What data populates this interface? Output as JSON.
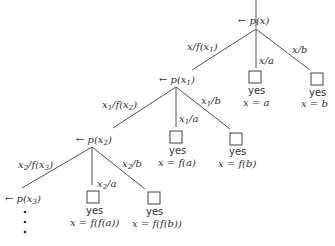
{
  "diagram": {
    "type": "search-tree",
    "nodes": [
      {
        "id": "root",
        "label": "← p(x)"
      },
      {
        "id": "n1",
        "label": "← p(x1)"
      },
      {
        "id": "n2",
        "label": "← p(x2)"
      },
      {
        "id": "n3",
        "label": "← p(x3)"
      }
    ],
    "edges": [
      {
        "from": "root",
        "to": "n1",
        "label": "x/f(x1)"
      },
      {
        "from": "root",
        "to": "leaf-a",
        "label": "x/a"
      },
      {
        "from": "root",
        "to": "leaf-b",
        "label": "x/b"
      },
      {
        "from": "n1",
        "to": "n2",
        "label": "x1/f(x2)"
      },
      {
        "from": "n1",
        "to": "leaf-fa",
        "label": "x1/a"
      },
      {
        "from": "n1",
        "to": "leaf-fb",
        "label": "x1/b"
      },
      {
        "from": "n2",
        "to": "n3",
        "label": "x2/f(x3)"
      },
      {
        "from": "n2",
        "to": "leaf-ffa",
        "label": "x2/a"
      },
      {
        "from": "n2",
        "to": "leaf-ffb",
        "label": "x2/b"
      }
    ],
    "leaves": [
      {
        "id": "leaf-a",
        "status": "yes",
        "answer": "x = a"
      },
      {
        "id": "leaf-b",
        "status": "yes",
        "answer": "x = b"
      },
      {
        "id": "leaf-fa",
        "status": "yes",
        "answer": "x = f(a)"
      },
      {
        "id": "leaf-fb",
        "status": "yes",
        "answer": "x = f(b)"
      },
      {
        "id": "leaf-ffa",
        "status": "yes",
        "answer": "x = f(f(a))"
      },
      {
        "id": "leaf-ffb",
        "status": "yes",
        "answer": "x = f(f(b))"
      }
    ],
    "continuation": "⋮"
  }
}
